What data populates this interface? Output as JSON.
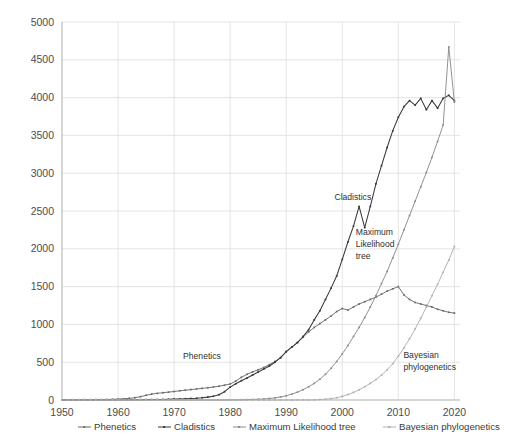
{
  "chart_data": {
    "type": "line",
    "title": "",
    "xlabel": "",
    "ylabel": "",
    "xlim": [
      1950,
      2021
    ],
    "ylim": [
      0,
      5000
    ],
    "grid": true,
    "legend_position": "bottom",
    "y_ticks": [
      0,
      500,
      1000,
      1500,
      2000,
      2500,
      3000,
      3500,
      4000,
      4500,
      5000
    ],
    "x_ticks": [
      1950,
      1960,
      1970,
      1980,
      1990,
      2000,
      2010,
      2020
    ],
    "x": [
      1950,
      1951,
      1952,
      1953,
      1954,
      1955,
      1956,
      1957,
      1958,
      1959,
      1960,
      1961,
      1962,
      1963,
      1964,
      1965,
      1966,
      1967,
      1968,
      1969,
      1970,
      1971,
      1972,
      1973,
      1974,
      1975,
      1976,
      1977,
      1978,
      1979,
      1980,
      1981,
      1982,
      1983,
      1984,
      1985,
      1986,
      1987,
      1988,
      1989,
      1990,
      1991,
      1992,
      1993,
      1994,
      1995,
      1996,
      1997,
      1998,
      1999,
      2000,
      2001,
      2002,
      2003,
      2004,
      2005,
      2006,
      2007,
      2008,
      2009,
      2010,
      2011,
      2012,
      2013,
      2014,
      2015,
      2016,
      2017,
      2018,
      2019,
      2020
    ],
    "series": [
      {
        "name": "Phenetics",
        "color": "#6b6b6b",
        "values": [
          2,
          2,
          3,
          3,
          4,
          4,
          5,
          6,
          7,
          9,
          12,
          16,
          22,
          30,
          44,
          62,
          78,
          88,
          96,
          104,
          112,
          122,
          130,
          138,
          146,
          154,
          162,
          172,
          182,
          196,
          212,
          250,
          300,
          340,
          372,
          400,
          430,
          468,
          510,
          560,
          640,
          700,
          760,
          830,
          900,
          960,
          1010,
          1060,
          1110,
          1170,
          1210,
          1190,
          1230,
          1270,
          1300,
          1330,
          1360,
          1400,
          1440,
          1470,
          1500,
          1390,
          1330,
          1290,
          1270,
          1250,
          1230,
          1200,
          1180,
          1160,
          1150
        ]
      },
      {
        "name": "Cladistics",
        "color": "#3a3a3a",
        "values": [
          0,
          0,
          0,
          0,
          0,
          0,
          0,
          0,
          0,
          1,
          1,
          2,
          2,
          3,
          4,
          5,
          6,
          7,
          8,
          10,
          12,
          14,
          17,
          20,
          24,
          30,
          38,
          50,
          70,
          110,
          170,
          215,
          255,
          290,
          330,
          370,
          410,
          450,
          500,
          560,
          640,
          700,
          760,
          840,
          930,
          1060,
          1180,
          1330,
          1480,
          1640,
          1860,
          2090,
          2300,
          2560,
          2280,
          2560,
          2860,
          3100,
          3340,
          3560,
          3740,
          3880,
          3960,
          3900,
          3990,
          3840,
          3960,
          3860,
          3990,
          4030,
          3960
        ]
      },
      {
        "name": "Maximum Likelihood tree",
        "color": "#8c8c8c",
        "values": [
          0,
          0,
          0,
          0,
          0,
          0,
          0,
          0,
          0,
          0,
          0,
          0,
          0,
          0,
          0,
          0,
          0,
          0,
          0,
          0,
          0,
          0,
          0,
          0,
          0,
          0,
          0,
          0,
          0,
          1,
          2,
          3,
          4,
          5,
          7,
          10,
          14,
          20,
          28,
          40,
          56,
          78,
          104,
          136,
          175,
          220,
          275,
          340,
          420,
          510,
          610,
          720,
          840,
          960,
          1090,
          1230,
          1380,
          1540,
          1700,
          1880,
          2060,
          2250,
          2440,
          2630,
          2820,
          3010,
          3210,
          3420,
          3640,
          4670,
          3940
        ]
      },
      {
        "name": "Bayesian phylogenetics",
        "color": "#b0b0b0",
        "values": [
          0,
          0,
          0,
          0,
          0,
          0,
          0,
          0,
          0,
          0,
          0,
          0,
          0,
          0,
          0,
          0,
          0,
          0,
          0,
          0,
          0,
          0,
          0,
          0,
          0,
          0,
          0,
          0,
          0,
          0,
          0,
          0,
          0,
          0,
          0,
          0,
          0,
          0,
          0,
          0,
          0,
          0,
          0,
          0,
          0,
          2,
          5,
          10,
          18,
          30,
          48,
          72,
          100,
          135,
          175,
          220,
          270,
          330,
          400,
          480,
          580,
          690,
          810,
          940,
          1080,
          1230,
          1380,
          1530,
          1690,
          1850,
          2030
        ]
      }
    ],
    "annotations": [
      {
        "text": "Phenetics",
        "x": 1971.6,
        "y": 540
      },
      {
        "text": "Cladistics",
        "x": 1998.6,
        "y": 2640
      },
      {
        "text": "Maximum",
        "x": 2002.4,
        "y": 2180
      },
      {
        "text": "Likelihood",
        "x": 2002.4,
        "y": 2020
      },
      {
        "text": "tree",
        "x": 2002.4,
        "y": 1860
      },
      {
        "text": "Bayesian",
        "x": 2010.9,
        "y": 560
      },
      {
        "text": "phylogenetics",
        "x": 2010.9,
        "y": 400
      }
    ]
  },
  "legend": {
    "items": [
      {
        "label": "Phenetics",
        "color": "#6b6b6b"
      },
      {
        "label": "Cladistics",
        "color": "#3a3a3a"
      },
      {
        "label": "Maximum Likelihood tree",
        "color": "#8c8c8c"
      },
      {
        "label": "Bayesian phylogenetics",
        "color": "#b0b0b0"
      }
    ]
  }
}
